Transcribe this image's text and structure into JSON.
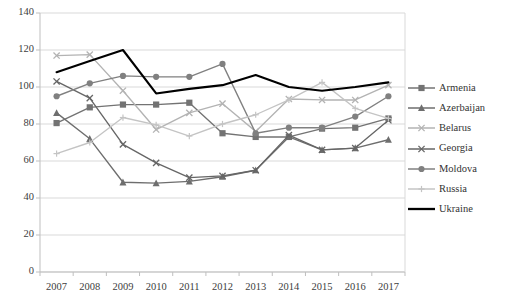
{
  "chart_data": {
    "type": "line",
    "title": "",
    "subtitle": "",
    "xlabel": "",
    "ylabel": "",
    "categories": [
      "2007",
      "2008",
      "2009",
      "2010",
      "2011",
      "2012",
      "2013",
      "2014",
      "2015",
      "2016",
      "2017"
    ],
    "x": [
      2007,
      2008,
      2009,
      2010,
      2011,
      2012,
      2013,
      2014,
      2015,
      2016,
      2017
    ],
    "ylim": [
      0,
      140
    ],
    "yticks": [
      0,
      20,
      40,
      60,
      80,
      100,
      120,
      140
    ],
    "grid": "horizontal",
    "legend_position": "right",
    "series": [
      {
        "name": "Armenia",
        "marker": "square",
        "color": "#737373",
        "values": [
          80.5,
          89,
          90.5,
          90.5,
          91.5,
          75,
          73,
          73,
          77.5,
          78,
          83
        ]
      },
      {
        "name": "Azerbaijan",
        "marker": "triangle",
        "color": "#6e6e6e",
        "values": [
          86,
          72,
          48.5,
          48,
          49,
          51.5,
          55,
          73,
          66,
          67,
          71.5
        ]
      },
      {
        "name": "Belarus",
        "marker": "x",
        "color": "#b3b3b3",
        "values": [
          117,
          117.5,
          98,
          77,
          86,
          91,
          76,
          93.5,
          93,
          93,
          101
        ]
      },
      {
        "name": "Georgia",
        "marker": "x",
        "color": "#666666",
        "values": [
          103,
          94,
          69,
          59,
          51,
          52,
          55,
          74,
          66,
          67,
          82
        ]
      },
      {
        "name": "Moldova",
        "marker": "circle",
        "color": "#808080",
        "values": [
          95,
          102,
          106,
          105.5,
          105.5,
          112.5,
          75,
          78,
          78,
          84,
          95
        ]
      },
      {
        "name": "Russia",
        "marker": "plus",
        "color": "#c4c4c4",
        "values": [
          64,
          70,
          83.5,
          79.5,
          73.5,
          80,
          85,
          93,
          102.5,
          88.5,
          83
        ]
      },
      {
        "name": "Ukraine",
        "marker": "none",
        "color": "#000000",
        "values": [
          108,
          114,
          120,
          96.5,
          99,
          101,
          106.5,
          100,
          98,
          100,
          102.5
        ]
      }
    ]
  },
  "axes": {
    "y_tick_labels": [
      "140",
      "120",
      "100",
      "80",
      "60",
      "40",
      "20",
      "0"
    ],
    "x_tick_labels": [
      "2007",
      "2008",
      "2009",
      "2010",
      "2011",
      "2012",
      "2013",
      "2014",
      "2015",
      "2016",
      "2017"
    ]
  },
  "legend": {
    "items": [
      {
        "label": "Armenia"
      },
      {
        "label": "Azerbaijan"
      },
      {
        "label": "Belarus"
      },
      {
        "label": "Georgia"
      },
      {
        "label": "Moldova"
      },
      {
        "label": "Russia"
      },
      {
        "label": "Ukraine"
      }
    ]
  },
  "colors": {
    "grid": "#d9d9d9",
    "axis": "#bfbfbf",
    "text": "#404040",
    "background": "#ffffff"
  }
}
